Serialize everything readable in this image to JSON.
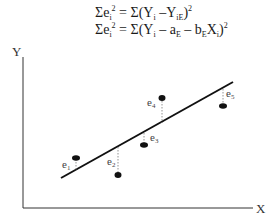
{
  "formulas": {
    "line1": {
      "lhs": "Σe",
      "lhs_sub": "i",
      "lhs_sup": "2",
      "eq": " = Σ(Y",
      "y_sub": "i",
      "minus": " –Y",
      "ye_sub": "iE",
      "close": ")",
      "sup": "2"
    },
    "line2": {
      "lhs": "Σe",
      "lhs_sub": "i",
      "lhs_sup": "2",
      "eq": " = Σ(Y",
      "y_sub": "i",
      "minus_a": " – a",
      "a_sub": "E",
      "minus_b": " – b",
      "b_sub": "E",
      "x": "X",
      "x_sub": "i",
      "close": ")",
      "sup": "2"
    }
  },
  "axes": {
    "y_label": "Y",
    "x_label": "X"
  },
  "residuals": [
    {
      "label": "e",
      "sub": "1"
    },
    {
      "label": "e",
      "sub": "2"
    },
    {
      "label": "e",
      "sub": "3"
    },
    {
      "label": "e",
      "sub": "4"
    },
    {
      "label": "e",
      "sub": "5"
    }
  ],
  "colors": {
    "ink": "#111111",
    "dotted": "#777777",
    "axis": "#333333"
  }
}
